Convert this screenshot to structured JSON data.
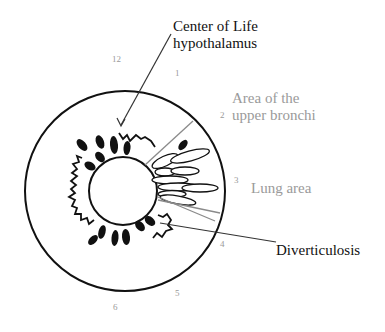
{
  "labels": {
    "center_of_life_line1": "Center of Life",
    "center_of_life_line2": "hypothalamus",
    "upper_bronchi_line1": "Area of the",
    "upper_bronchi_line2": "upper bronchi",
    "lung_area": "Lung area",
    "diverticulosis": "Diverticulosis"
  },
  "clock_numbers": {
    "n12": "12",
    "n1": "1",
    "n2": "2",
    "n3": "3",
    "n4": "4",
    "n5": "5",
    "n6": "6"
  },
  "colors": {
    "ink": "#111111",
    "gray_text": "#9a9a9a",
    "gray_line": "#8a8a8a"
  }
}
